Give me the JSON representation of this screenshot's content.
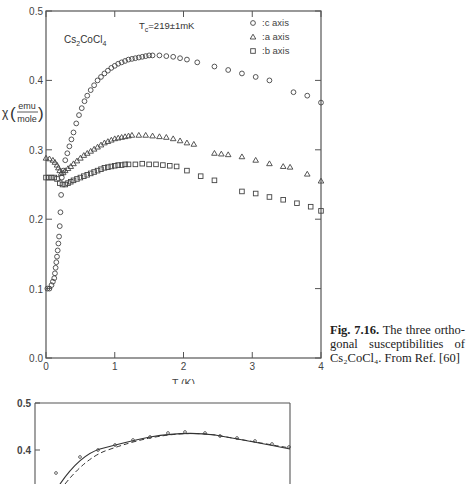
{
  "chart_data": [
    {
      "type": "scatter",
      "title": "",
      "annotations": [
        "Cs2CoCl4",
        "Tc=219±1mK"
      ],
      "xlabel": "T (K)",
      "ylabel": "χ (emu/mole)",
      "xlim": [
        0,
        4
      ],
      "ylim": [
        0.0,
        0.5
      ],
      "xticks": [
        "0",
        "1",
        "2",
        "3",
        "4"
      ],
      "yticks": [
        "0.0",
        "0.1",
        "0.2",
        "0.3",
        "0.4",
        "0.5"
      ],
      "grid": false,
      "legend_position": "top-right",
      "legend": [
        {
          "marker": "circle",
          "label": ":c  axis"
        },
        {
          "marker": "triangle",
          "label": ":a  axis"
        },
        {
          "marker": "square",
          "label": ":b  axis"
        }
      ],
      "series": [
        {
          "name": "c axis",
          "marker": "circle",
          "x": [
            0.02,
            0.05,
            0.08,
            0.1,
            0.12,
            0.13,
            0.14,
            0.15,
            0.16,
            0.17,
            0.18,
            0.19,
            0.2,
            0.21,
            0.22,
            0.23,
            0.25,
            0.28,
            0.31,
            0.34,
            0.37,
            0.4,
            0.44,
            0.48,
            0.52,
            0.56,
            0.6,
            0.65,
            0.7,
            0.75,
            0.8,
            0.85,
            0.9,
            0.95,
            1.0,
            1.05,
            1.1,
            1.15,
            1.2,
            1.25,
            1.3,
            1.35,
            1.4,
            1.45,
            1.5,
            1.55,
            1.65,
            1.75,
            1.85,
            1.95,
            2.05,
            2.2,
            2.45,
            2.65,
            2.85,
            3.05,
            3.25,
            3.6,
            3.8,
            4.0
          ],
          "y": [
            0.1,
            0.1,
            0.105,
            0.11,
            0.115,
            0.122,
            0.13,
            0.138,
            0.146,
            0.155,
            0.165,
            0.175,
            0.19,
            0.21,
            0.235,
            0.26,
            0.27,
            0.285,
            0.295,
            0.305,
            0.315,
            0.325,
            0.338,
            0.35,
            0.36,
            0.37,
            0.378,
            0.386,
            0.393,
            0.4,
            0.405,
            0.41,
            0.414,
            0.418,
            0.421,
            0.424,
            0.426,
            0.428,
            0.43,
            0.431,
            0.432,
            0.433,
            0.434,
            0.435,
            0.436,
            0.436,
            0.436,
            0.435,
            0.434,
            0.432,
            0.43,
            0.426,
            0.42,
            0.415,
            0.41,
            0.405,
            0.4,
            0.383,
            0.378,
            0.368
          ]
        },
        {
          "name": "a axis",
          "marker": "triangle",
          "x": [
            0.0,
            0.05,
            0.1,
            0.13,
            0.16,
            0.18,
            0.2,
            0.22,
            0.25,
            0.28,
            0.32,
            0.36,
            0.4,
            0.45,
            0.5,
            0.55,
            0.6,
            0.65,
            0.7,
            0.75,
            0.8,
            0.85,
            0.9,
            0.95,
            1.0,
            1.05,
            1.1,
            1.15,
            1.2,
            1.25,
            1.35,
            1.45,
            1.55,
            1.65,
            1.75,
            1.85,
            1.95,
            2.05,
            2.15,
            2.45,
            2.55,
            2.65,
            2.85,
            3.05,
            3.25,
            3.45,
            3.55,
            3.8,
            4.0
          ],
          "y": [
            0.288,
            0.287,
            0.285,
            0.282,
            0.278,
            0.274,
            0.27,
            0.266,
            0.267,
            0.27,
            0.273,
            0.276,
            0.28,
            0.284,
            0.288,
            0.292,
            0.295,
            0.298,
            0.301,
            0.304,
            0.307,
            0.31,
            0.312,
            0.314,
            0.316,
            0.317,
            0.318,
            0.319,
            0.32,
            0.321,
            0.321,
            0.321,
            0.32,
            0.319,
            0.318,
            0.316,
            0.313,
            0.31,
            0.308,
            0.295,
            0.294,
            0.293,
            0.29,
            0.285,
            0.28,
            0.276,
            0.275,
            0.265,
            0.255
          ]
        },
        {
          "name": "b axis",
          "marker": "square",
          "x": [
            0.0,
            0.04,
            0.08,
            0.12,
            0.16,
            0.2,
            0.24,
            0.28,
            0.32,
            0.36,
            0.4,
            0.45,
            0.5,
            0.55,
            0.6,
            0.65,
            0.7,
            0.75,
            0.8,
            0.85,
            0.9,
            0.95,
            1.0,
            1.05,
            1.1,
            1.15,
            1.2,
            1.3,
            1.4,
            1.5,
            1.6,
            1.7,
            1.8,
            1.9,
            2.05,
            2.25,
            2.45,
            2.85,
            3.05,
            3.25,
            3.45,
            3.65,
            3.85,
            4.0
          ],
          "y": [
            0.26,
            0.26,
            0.26,
            0.26,
            0.258,
            0.252,
            0.25,
            0.25,
            0.252,
            0.254,
            0.256,
            0.258,
            0.26,
            0.262,
            0.264,
            0.266,
            0.268,
            0.27,
            0.272,
            0.274,
            0.275,
            0.276,
            0.277,
            0.278,
            0.278,
            0.279,
            0.279,
            0.279,
            0.28,
            0.279,
            0.279,
            0.278,
            0.277,
            0.276,
            0.27,
            0.262,
            0.256,
            0.24,
            0.237,
            0.232,
            0.228,
            0.223,
            0.218,
            0.212
          ]
        }
      ]
    },
    {
      "type": "line",
      "partial": true,
      "ylim": [
        0.3,
        0.5
      ],
      "yticks": [
        "0.5",
        "0.4"
      ],
      "series": [
        {
          "name": "solid fit",
          "style": "solid"
        },
        {
          "name": "dashed fit",
          "style": "dashed"
        },
        {
          "name": "data",
          "marker": "circle"
        }
      ]
    }
  ],
  "chart": {
    "compound_main": "Cs",
    "compound_sub1": "2",
    "compound_mid": "CoCl",
    "compound_sub2": "4",
    "tc_prefix": "T",
    "tc_sub": "c",
    "tc_value": "=219±1mK",
    "chi_symbol": "χ",
    "chi_num": "emu",
    "chi_den": "mole",
    "xlabel": "T (K)"
  },
  "caption": {
    "label": "Fig. 7.16.",
    "text": "The three ortho-gonal susceptibilities of",
    "compound": "Cs₂CoCl₄. From Ref. [60]"
  }
}
